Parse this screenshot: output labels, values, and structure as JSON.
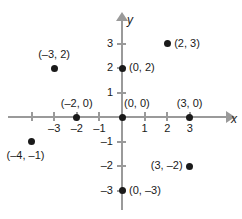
{
  "chart_data": {
    "type": "scatter",
    "title": "",
    "xlabel": "x",
    "ylabel": "y",
    "grid": false,
    "legend": false,
    "xlim": [
      -5,
      4
    ],
    "ylim": [
      -4,
      4
    ],
    "x_ticks": [
      {
        "value": -4,
        "label": ""
      },
      {
        "value": -3,
        "label": "–3"
      },
      {
        "value": -2,
        "label": "–2"
      },
      {
        "value": -1,
        "label": "–1"
      },
      {
        "value": 1,
        "label": "1"
      },
      {
        "value": 2,
        "label": "2"
      },
      {
        "value": 3,
        "label": "3"
      }
    ],
    "y_ticks": [
      {
        "value": 3,
        "label": "3"
      },
      {
        "value": 2,
        "label": "2"
      },
      {
        "value": 1,
        "label": "1"
      },
      {
        "value": -1,
        "label": "–1"
      },
      {
        "value": -2,
        "label": "–2"
      },
      {
        "value": -3,
        "label": "–3"
      }
    ],
    "points": [
      {
        "x": -3,
        "y": 2,
        "label": "(–3, 2)",
        "label_pos": "above"
      },
      {
        "x": 2,
        "y": 3,
        "label": "(2, 3)",
        "label_pos": "right"
      },
      {
        "x": 0,
        "y": 2,
        "label": "(0, 2)",
        "label_pos": "right"
      },
      {
        "x": -2,
        "y": 0,
        "label": "(–2, 0)",
        "label_pos": "above"
      },
      {
        "x": 0,
        "y": 0,
        "label": "(0, 0)",
        "label_pos": "above-right"
      },
      {
        "x": 3,
        "y": 0,
        "label": "(3, 0)",
        "label_pos": "above"
      },
      {
        "x": -4,
        "y": -1,
        "label": "(–4, –1)",
        "label_pos": "below"
      },
      {
        "x": 3,
        "y": -2,
        "label": "(3, –2)",
        "label_pos": "left"
      },
      {
        "x": 0,
        "y": -3,
        "label": "(0, –3)",
        "label_pos": "right"
      }
    ]
  },
  "axes": {
    "x_name": "x",
    "y_name": "y"
  },
  "colors": {
    "axis": "#9a9a9a",
    "point": "#1a1a1a",
    "text": "#1a1a1a",
    "background": "#ffffff"
  }
}
